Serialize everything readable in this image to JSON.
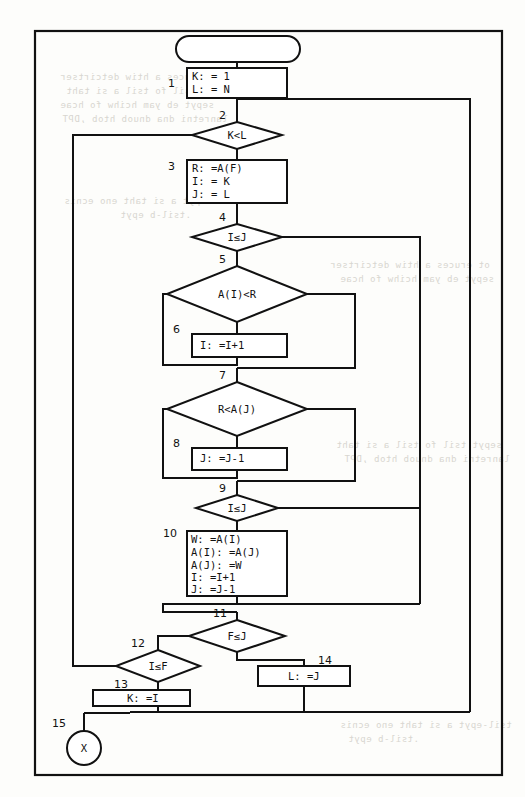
{
  "figure": {
    "type": "flowchart",
    "frame": {
      "stroke": "#111111"
    },
    "ghost_text": [
      "ot eruces a htiw detcirtser",
      "sepyt tsil fo tsil a si taht",
      "sepyt eb yam hcihw fo hcae",
      "lanretni dna dnuob htob ,DPT",
      "tsil-epyt a si taht eno ecnis",
      ".tsil-b epyt"
    ]
  },
  "nodes": [
    {
      "id": "start",
      "label": "",
      "number": "",
      "shape": "terminal"
    },
    {
      "id": "n1",
      "label": "K: = 1\nL: = N",
      "number": "1",
      "shape": "process"
    },
    {
      "id": "n2",
      "label": "K<L",
      "number": "2",
      "shape": "decision"
    },
    {
      "id": "n3",
      "label": "R: =A(F)\nI: = K\nJ: = L",
      "number": "3",
      "shape": "process"
    },
    {
      "id": "n4",
      "label": "I≤J",
      "number": "4",
      "shape": "decision"
    },
    {
      "id": "n5",
      "label": "A(I)<R",
      "number": "5",
      "shape": "decision"
    },
    {
      "id": "n6",
      "label": "I: =I+1",
      "number": "6",
      "shape": "process"
    },
    {
      "id": "n7",
      "label": "R<A(J)",
      "number": "7",
      "shape": "decision"
    },
    {
      "id": "n8",
      "label": "J: =J-1",
      "number": "8",
      "shape": "process"
    },
    {
      "id": "n9",
      "label": "I≤J",
      "number": "9",
      "shape": "decision"
    },
    {
      "id": "n10",
      "label": "W: =A(I)\nA(I): =A(J)\nA(J): =W\nI: =I+1\nJ: =J-1",
      "number": "10",
      "shape": "process"
    },
    {
      "id": "n11",
      "label": "F≤J",
      "number": "11",
      "shape": "decision"
    },
    {
      "id": "n12",
      "label": "I≤F",
      "number": "12",
      "shape": "decision"
    },
    {
      "id": "n13",
      "label": "K: =I",
      "number": "13",
      "shape": "process"
    },
    {
      "id": "n14",
      "label": "L: =J",
      "number": "14",
      "shape": "process"
    },
    {
      "id": "n15",
      "label": "X",
      "number": "15",
      "shape": "connector"
    }
  ],
  "labels": {
    "start_label": "",
    "n1_line1": "K: = 1",
    "n1_line2": "L: = N",
    "n1_num": "1",
    "n2_text": "K<L",
    "n2_num": "2",
    "n3_line1": "R: =A(F)",
    "n3_line2": "I: = K",
    "n3_line3": "J: = L",
    "n3_num": "3",
    "n4_text": "I≤J",
    "n4_num": "4",
    "n5_text": "A(I)<R",
    "n5_num": "5",
    "n6_text": "I: =I+1",
    "n6_num": "6",
    "n7_text": "R<A(J)",
    "n7_num": "7",
    "n8_text": "J: =J-1",
    "n8_num": "8",
    "n9_text": "I≤J",
    "n9_num": "9",
    "n10_line1": "W: =A(I)",
    "n10_line2": "A(I): =A(J)",
    "n10_line3": "A(J): =W",
    "n10_line4": "I: =I+1",
    "n10_line5": "J: =J-1",
    "n10_num": "10",
    "n11_text": "F≤J",
    "n11_num": "11",
    "n12_text": "I≤F",
    "n12_num": "12",
    "n13_text": "K: =I",
    "n13_num": "13",
    "n14_text": "L: =J",
    "n14_num": "14",
    "n15_text": "X",
    "n15_num": "15"
  }
}
